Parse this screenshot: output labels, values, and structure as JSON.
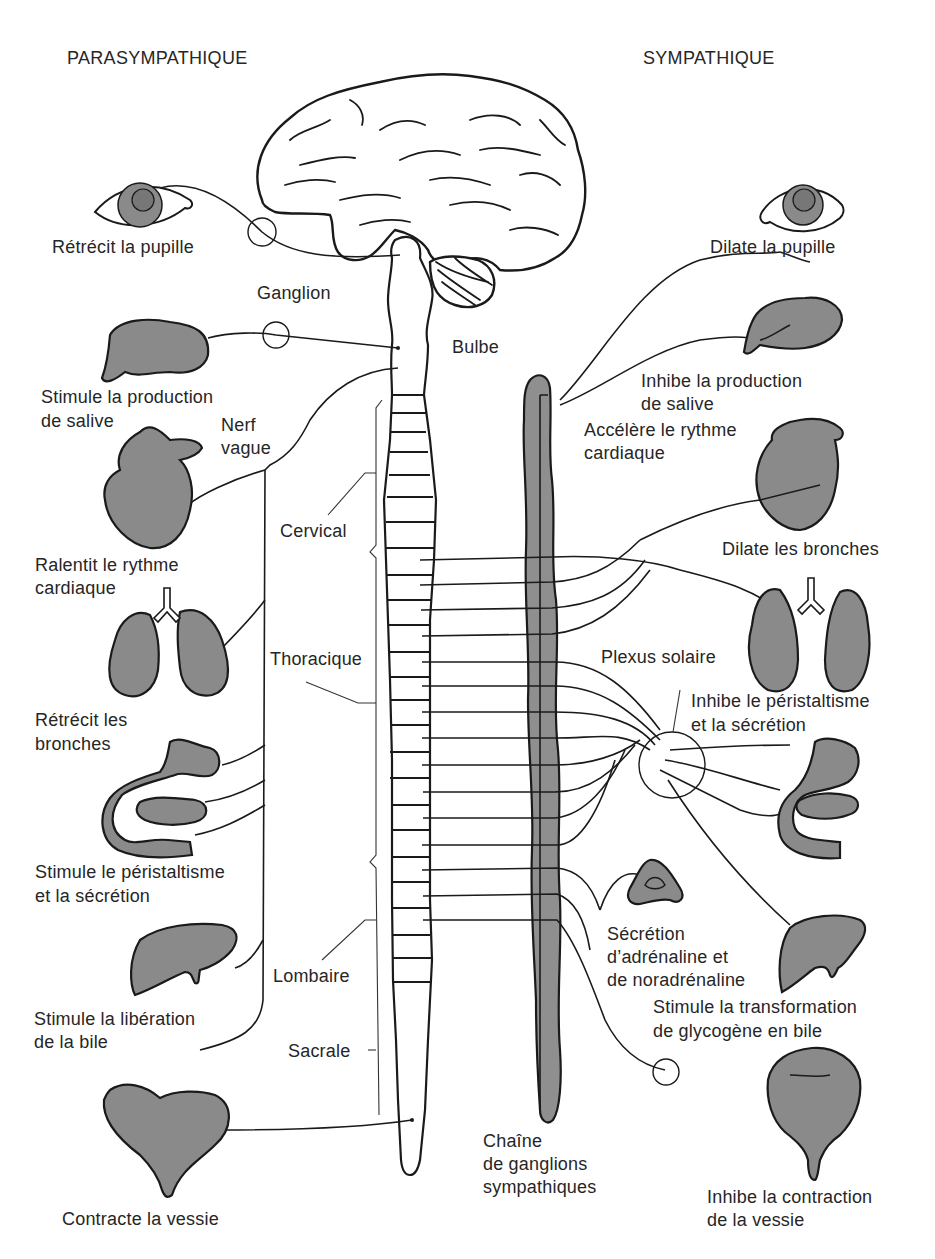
{
  "headers": {
    "left": "PARASYMPATHIQUE",
    "right": "SYMPATHIQUE"
  },
  "center_labels": {
    "ganglion": "Ganglion",
    "bulbe": "Bulbe",
    "nerf_vague_1": "Nerf",
    "nerf_vague_2": "vague",
    "cervical": "Cervical",
    "thoracique": "Thoracique",
    "lombaire": "Lombaire",
    "sacrale": "Sacrale",
    "chain_1": "Chaîne",
    "chain_2": "de ganglions",
    "chain_3": "sympathiques",
    "plexus": "Plexus solaire"
  },
  "parasympathetic": [
    {
      "organ": "eye",
      "lines": [
        "Rétrécit la pupille"
      ]
    },
    {
      "organ": "salivary-gland",
      "lines": [
        "Stimule la production",
        "de salive"
      ]
    },
    {
      "organ": "heart",
      "lines": [
        "Ralentit le rythme",
        "cardiaque"
      ]
    },
    {
      "organ": "lungs",
      "lines": [
        "Rétrécit les",
        "bronches"
      ]
    },
    {
      "organ": "stomach-intestine",
      "lines": [
        "Stimule le péristaltisme",
        "et la sécrétion"
      ]
    },
    {
      "organ": "liver",
      "lines": [
        "Stimule la libération",
        "de la bile"
      ]
    },
    {
      "organ": "bladder",
      "lines": [
        "Contracte la vessie"
      ]
    }
  ],
  "sympathetic": [
    {
      "organ": "eye",
      "lines": [
        "Dilate la pupille"
      ]
    },
    {
      "organ": "salivary-gland",
      "lines": [
        "Inhibe la production",
        "de salive"
      ]
    },
    {
      "organ": "heart",
      "lines": [
        "Accélère le rythme",
        "cardiaque"
      ]
    },
    {
      "organ": "lungs",
      "lines": [
        "Dilate les bronches"
      ]
    },
    {
      "organ": "stomach-intestine",
      "lines": [
        "Inhibe le péristaltisme",
        "et la sécrétion"
      ]
    },
    {
      "organ": "adrenal-gland",
      "lines": [
        "Sécrétion",
        "d’adrénaline et",
        "de noradrénaline"
      ]
    },
    {
      "organ": "liver",
      "lines": [
        "Stimule la transformation",
        "de glycogène en bile"
      ]
    },
    {
      "organ": "bladder",
      "lines": [
        "Inhibe la contraction",
        "de la vessie"
      ]
    }
  ],
  "colors": {
    "organ_fill": "#8a8a8a",
    "ink": "#1a1a1a",
    "background": "#ffffff"
  }
}
